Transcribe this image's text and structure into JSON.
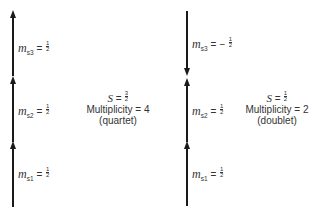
{
  "diagram": {
    "quartet": {
      "spins": [
        {
          "label": "m",
          "sub": "s3",
          "sign": "",
          "num": "1",
          "den": "2",
          "direction": "up"
        },
        {
          "label": "m",
          "sub": "s2",
          "sign": "",
          "num": "1",
          "den": "2",
          "direction": "up"
        },
        {
          "label": "m",
          "sub": "s1",
          "sign": "",
          "num": "1",
          "den": "2",
          "direction": "up"
        }
      ],
      "S_label": "S",
      "S_num": "3",
      "S_den": "2",
      "multiplicity_text": "Multiplicity = 4",
      "state_name": "(quartet)"
    },
    "doublet": {
      "spins": [
        {
          "label": "m",
          "sub": "s3",
          "sign": "−",
          "num": "1",
          "den": "2",
          "direction": "down"
        },
        {
          "label": "m",
          "sub": "s2",
          "sign": "",
          "num": "1",
          "den": "2",
          "direction": "up"
        },
        {
          "label": "m",
          "sub": "s1",
          "sign": "",
          "num": "1",
          "den": "2",
          "direction": "up"
        }
      ],
      "S_label": "S",
      "S_num": "1",
      "S_den": "2",
      "multiplicity_text": "Multiplicity = 2",
      "state_name": "(doublet)"
    },
    "equals": "="
  }
}
